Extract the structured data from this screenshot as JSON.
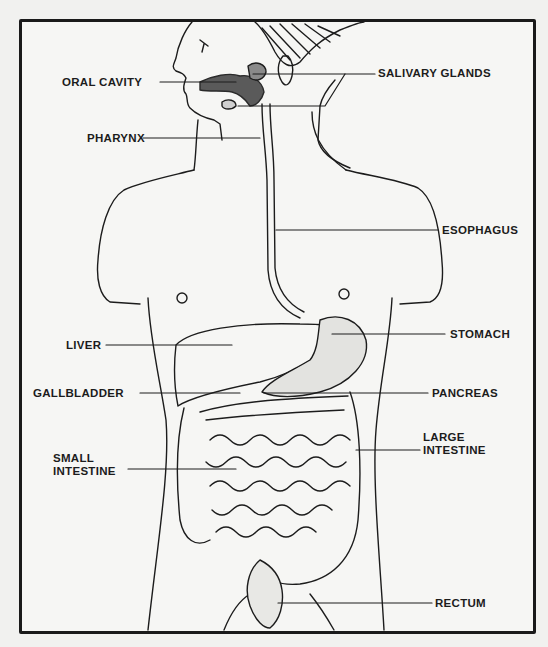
{
  "diagram": {
    "labels": [
      {
        "id": "oral-cavity",
        "text": "ORAL CAVITY",
        "x": 62,
        "y": 76,
        "side": "left"
      },
      {
        "id": "salivary-glands",
        "text": "SALIVARY GLANDS",
        "x": 378,
        "y": 66,
        "side": "right"
      },
      {
        "id": "pharynx",
        "text": "PHARYNX",
        "x": 87,
        "y": 132,
        "side": "left"
      },
      {
        "id": "esophagus",
        "text": "ESOPHAGUS",
        "x": 442,
        "y": 223,
        "side": "right"
      },
      {
        "id": "stomach",
        "text": "STOMACH",
        "x": 450,
        "y": 327,
        "side": "right"
      },
      {
        "id": "liver",
        "text": "LIVER",
        "x": 66,
        "y": 340,
        "side": "left"
      },
      {
        "id": "gallbladder",
        "text": "GALLBLADDER",
        "x": 33,
        "y": 387,
        "side": "left"
      },
      {
        "id": "pancreas",
        "text": "PANCREAS",
        "x": 432,
        "y": 386,
        "side": "right"
      },
      {
        "id": "large-intestine",
        "text": "LARGE\nINTESTINE",
        "x": 423,
        "y": 432,
        "side": "right"
      },
      {
        "id": "small-intestine",
        "text": "SMALL\nINTESTINE",
        "x": 53,
        "y": 452,
        "side": "left"
      },
      {
        "id": "rectum",
        "text": "RECTUM",
        "x": 435,
        "y": 597,
        "side": "right"
      }
    ]
  }
}
